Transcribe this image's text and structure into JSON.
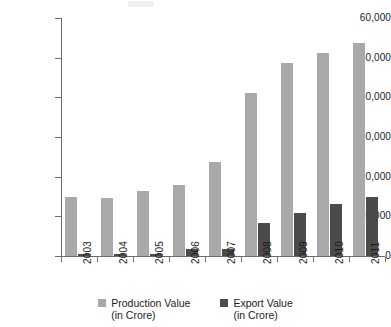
{
  "chart_data": {
    "type": "bar",
    "title": "",
    "subtitle": "",
    "xlabel": "",
    "ylabel": "",
    "categories": [
      "2003",
      "2004",
      "2005",
      "2006",
      "2007",
      "2008",
      "2009",
      "2010",
      "2011"
    ],
    "series": [
      {
        "name": "Production Value",
        "unit": "in Crore",
        "color": "#a9a9a9",
        "values": [
          14800,
          14700,
          16400,
          18000,
          23600,
          41100,
          48600,
          51100,
          53700
        ]
      },
      {
        "name": "Export Value",
        "unit": "in Crore",
        "color": "#4b4b4b",
        "values": [
          550,
          520,
          550,
          1650,
          1850,
          8300,
          10800,
          13200,
          14900
        ]
      }
    ],
    "ylim": [
      0,
      60000
    ],
    "ytick_values": [
      0,
      10000,
      20000,
      30000,
      40000,
      50000,
      60000
    ],
    "ytick_labels": [
      "0",
      "10,000",
      "20,000",
      "30,000",
      "40,000",
      "50,000",
      "60,000"
    ],
    "grid": false,
    "legend_position": "bottom"
  },
  "legend": {
    "items": [
      {
        "label": "Production Value",
        "sublabel": "(in Crore)",
        "color": "#a9a9a9"
      },
      {
        "label": "Export Value",
        "sublabel": "(in Crore)",
        "color": "#4b4b4b"
      }
    ]
  },
  "colors": {
    "production": "#a9a9a9",
    "export": "#4b4b4b",
    "axis": "#6d6d6d",
    "text": "#1b1b1b",
    "background": "#ffffff"
  }
}
